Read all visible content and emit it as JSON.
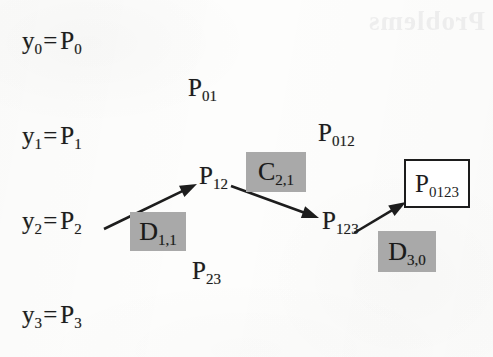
{
  "figure": {
    "kind": "neville-interpolation-scheme",
    "background_color": "#fdfdfc",
    "ink_color": "#1d1d1d",
    "chip_color": "#a9a9a9",
    "bleed_through_text": "Problems"
  },
  "inputs": [
    {
      "name": "y0",
      "var": "y",
      "var_sub": "0",
      "eq": "=",
      "poly": "P",
      "poly_sub": "0",
      "x": 22,
      "y": 28
    },
    {
      "name": "y1",
      "var": "y",
      "var_sub": "1",
      "eq": "=",
      "poly": "P",
      "poly_sub": "1",
      "x": 22,
      "y": 123
    },
    {
      "name": "y2",
      "var": "y",
      "var_sub": "2",
      "eq": "=",
      "poly": "P",
      "poly_sub": "2",
      "x": 22,
      "y": 208
    },
    {
      "name": "y3",
      "var": "y",
      "var_sub": "3",
      "eq": "=",
      "poly": "P",
      "poly_sub": "3",
      "x": 22,
      "y": 302
    }
  ],
  "intermediates": [
    {
      "name": "P01",
      "poly": "P",
      "poly_sub": "01",
      "x": 188,
      "y": 75
    },
    {
      "name": "P12",
      "poly": "P",
      "poly_sub": "12",
      "x": 199,
      "y": 163
    },
    {
      "name": "P23",
      "poly": "P",
      "poly_sub": "23",
      "x": 192,
      "y": 258
    },
    {
      "name": "P012",
      "poly": "P",
      "poly_sub": "012",
      "x": 318,
      "y": 120
    },
    {
      "name": "P123",
      "poly": "P",
      "poly_sub": "123",
      "x": 322,
      "y": 208
    }
  ],
  "result": {
    "name": "P0123",
    "poly": "P",
    "poly_sub": "0123",
    "x": 404,
    "y": 159,
    "width": 62,
    "height": 45
  },
  "operators": [
    {
      "name": "D11",
      "letter": "D",
      "sub": "1,1",
      "x": 130,
      "y": 212,
      "width": 56,
      "height": 39
    },
    {
      "name": "C21",
      "letter": "C",
      "sub": "2,1",
      "x": 246,
      "y": 152,
      "width": 60,
      "height": 40
    },
    {
      "name": "D30",
      "letter": "D",
      "sub": "3,0",
      "x": 378,
      "y": 231,
      "width": 58,
      "height": 41
    }
  ],
  "arrows": [
    {
      "name": "arrow-p2-to-p12",
      "x1": 104,
      "y1": 229,
      "x2": 197,
      "y2": 184
    },
    {
      "name": "arrow-p12-to-p123",
      "x1": 231,
      "y1": 186,
      "x2": 319,
      "y2": 218
    },
    {
      "name": "arrow-p123-to-p0123",
      "x1": 354,
      "y1": 233,
      "x2": 406,
      "y2": 202
    }
  ]
}
